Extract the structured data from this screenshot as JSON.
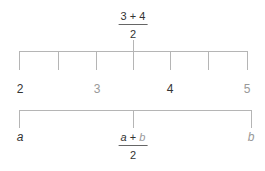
{
  "colors": {
    "line": "#b5b5b5",
    "dark_text": "#333333",
    "light_text": "#999999"
  },
  "top_fraction": {
    "numerator": "3 + 4",
    "denominator": "2"
  },
  "number_line": {
    "labels": [
      {
        "text": "2",
        "tone": "dark"
      },
      {
        "text": "3",
        "tone": "light"
      },
      {
        "text": "4",
        "tone": "dark"
      },
      {
        "text": "5",
        "tone": "light"
      }
    ]
  },
  "bottom_bracket": {
    "left": "a",
    "right": "b",
    "midpoint": {
      "numerator_a": "a",
      "numerator_op": " + ",
      "numerator_b": "b",
      "denominator": "2"
    }
  }
}
